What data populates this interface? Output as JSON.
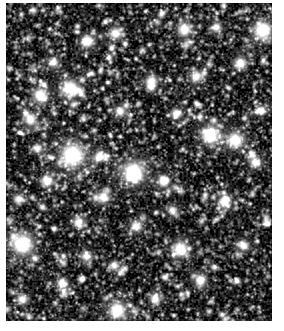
{
  "image": {
    "kind": "astronomical-photograph",
    "subject": "dense star field",
    "description": "Dense field of stars on black sky, monochrome astronomical image",
    "canvas": {
      "width": 284,
      "height": 331
    },
    "background_color": "#ffffff"
  },
  "starfield": {
    "name": "star-field-image",
    "frame": {
      "left": 6,
      "top": 3,
      "width": 266,
      "height": 318
    },
    "sky_color": "#000000",
    "star_color": "#ffffff",
    "star_count_faint": 5200,
    "star_count_medium": 900,
    "star_count_bright": 150,
    "noise_level": 0.22,
    "grain_cell": 2,
    "bright_stars": [
      {
        "x": 0.249,
        "y": 0.478,
        "r": 6.2,
        "i": 1.0
      },
      {
        "x": 0.478,
        "y": 0.531,
        "r": 5.6,
        "i": 1.0
      },
      {
        "x": 0.06,
        "y": 0.758,
        "r": 5.4,
        "i": 1.0
      },
      {
        "x": 0.963,
        "y": 0.085,
        "r": 4.8,
        "i": 0.95
      },
      {
        "x": 0.241,
        "y": 0.268,
        "r": 4.4,
        "i": 0.92
      },
      {
        "x": 0.767,
        "y": 0.415,
        "r": 4.6,
        "i": 0.95
      },
      {
        "x": 0.861,
        "y": 0.43,
        "r": 4.2,
        "i": 0.9
      },
      {
        "x": 0.654,
        "y": 0.775,
        "r": 4.0,
        "i": 0.9
      },
      {
        "x": 0.128,
        "y": 0.289,
        "r": 3.8,
        "i": 0.88
      },
      {
        "x": 0.417,
        "y": 0.965,
        "r": 4.4,
        "i": 0.95
      },
      {
        "x": 0.669,
        "y": 0.082,
        "r": 3.6,
        "i": 0.85
      },
      {
        "x": 0.305,
        "y": 0.12,
        "r": 3.4,
        "i": 0.84
      },
      {
        "x": 0.41,
        "y": 0.093,
        "r": 3.2,
        "i": 0.82
      },
      {
        "x": 0.88,
        "y": 0.19,
        "r": 3.3,
        "i": 0.83
      },
      {
        "x": 0.545,
        "y": 0.245,
        "r": 3.2,
        "i": 0.82
      },
      {
        "x": 0.716,
        "y": 0.23,
        "r": 3.0,
        "i": 0.8
      },
      {
        "x": 0.09,
        "y": 0.365,
        "r": 3.2,
        "i": 0.82
      },
      {
        "x": 0.155,
        "y": 0.56,
        "r": 3.0,
        "i": 0.8
      },
      {
        "x": 0.365,
        "y": 0.61,
        "r": 3.1,
        "i": 0.81
      },
      {
        "x": 0.59,
        "y": 0.56,
        "r": 3.0,
        "i": 0.8
      },
      {
        "x": 0.82,
        "y": 0.625,
        "r": 3.2,
        "i": 0.82
      },
      {
        "x": 0.935,
        "y": 0.5,
        "r": 3.0,
        "i": 0.8
      },
      {
        "x": 0.27,
        "y": 0.69,
        "r": 2.9,
        "i": 0.78
      },
      {
        "x": 0.49,
        "y": 0.7,
        "r": 3.0,
        "i": 0.8
      },
      {
        "x": 0.73,
        "y": 0.87,
        "r": 3.1,
        "i": 0.81
      },
      {
        "x": 0.21,
        "y": 0.88,
        "r": 2.9,
        "i": 0.78
      },
      {
        "x": 0.06,
        "y": 0.93,
        "r": 2.8,
        "i": 0.76
      },
      {
        "x": 0.56,
        "y": 0.93,
        "r": 2.8,
        "i": 0.76
      },
      {
        "x": 0.89,
        "y": 0.76,
        "r": 2.8,
        "i": 0.76
      },
      {
        "x": 0.43,
        "y": 0.34,
        "r": 2.8,
        "i": 0.76
      },
      {
        "x": 0.64,
        "y": 0.345,
        "r": 2.7,
        "i": 0.75
      },
      {
        "x": 0.175,
        "y": 0.185,
        "r": 2.7,
        "i": 0.75
      },
      {
        "x": 0.35,
        "y": 0.48,
        "r": 2.6,
        "i": 0.74
      },
      {
        "x": 0.79,
        "y": 0.075,
        "r": 2.6,
        "i": 0.74
      },
      {
        "x": 0.045,
        "y": 0.615,
        "r": 2.6,
        "i": 0.74
      },
      {
        "x": 0.96,
        "y": 0.335,
        "r": 2.6,
        "i": 0.74
      },
      {
        "x": 0.3,
        "y": 0.795,
        "r": 2.6,
        "i": 0.74
      },
      {
        "x": 0.115,
        "y": 0.455,
        "r": 2.5,
        "i": 0.72
      },
      {
        "x": 0.625,
        "y": 0.65,
        "r": 2.5,
        "i": 0.72
      },
      {
        "x": 0.405,
        "y": 0.825,
        "r": 2.5,
        "i": 0.72
      }
    ]
  }
}
